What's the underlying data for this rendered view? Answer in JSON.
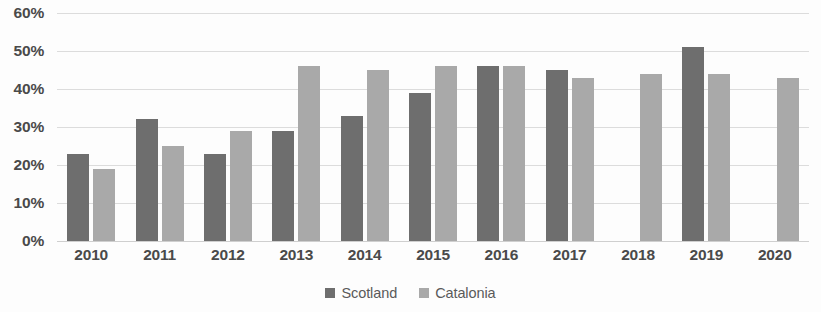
{
  "chart_data": {
    "type": "bar",
    "title": "",
    "subtitle": "",
    "xlabel": "",
    "ylabel": "",
    "ylim": [
      0,
      60
    ],
    "y_ticks": [
      "60%",
      "50%",
      "40%",
      "30%",
      "20%",
      "10%",
      "0%"
    ],
    "y_tick_values": [
      60,
      50,
      40,
      30,
      20,
      10,
      0
    ],
    "grid": true,
    "legend_position": "bottom-center",
    "categories": [
      "2010",
      "2011",
      "2012",
      "2013",
      "2014",
      "2015",
      "2016",
      "2017",
      "2018",
      "2019",
      "2020"
    ],
    "series": [
      {
        "name": "Scotland",
        "color": "#6e6e6e",
        "values": [
          23,
          32,
          23,
          29,
          33,
          39,
          46,
          45,
          null,
          51,
          null
        ]
      },
      {
        "name": "Catalonia",
        "color": "#a9a9a9",
        "values": [
          19,
          25,
          29,
          46,
          45,
          46,
          46,
          43,
          44,
          44,
          43
        ]
      }
    ]
  },
  "legend": {
    "items": [
      {
        "label": "Scotland",
        "color": "#6e6e6e",
        "marker": "square-swatch"
      },
      {
        "label": "Catalonia",
        "color": "#a9a9a9",
        "marker": "square-swatch"
      }
    ]
  }
}
